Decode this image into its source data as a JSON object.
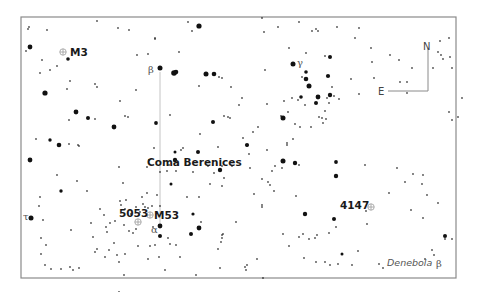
{
  "map": {
    "title": "Coma Berenices",
    "frame": {
      "x": 21,
      "y": 17,
      "width": 435,
      "height": 261,
      "color": "#8a8a8a"
    },
    "compass": {
      "north_label": "N",
      "east_label": "E",
      "corner_x": 428,
      "corner_y": 91,
      "north_top_y": 48,
      "east_left_x": 388
    },
    "constellation_label": {
      "text": "Coma Berenices",
      "x": 147,
      "y": 166
    },
    "objects": [
      {
        "id": "m3",
        "label": "M3",
        "x": 63,
        "y": 52,
        "label_x": 70,
        "label_y": 56
      },
      {
        "id": "m53",
        "label": "M53",
        "x": 150,
        "y": 215,
        "label_x": 155,
        "label_y": 219
      },
      {
        "id": "ngc5053",
        "label": "5053",
        "x": 138,
        "y": 222,
        "label_x": 120,
        "label_y": 217
      },
      {
        "id": "ngc4147",
        "label": "4147",
        "x": 371,
        "y": 207,
        "label_x": 340,
        "label_y": 209
      }
    ],
    "greek_labels": [
      {
        "text": "β",
        "x": 148,
        "y": 73,
        "star": "beta-com"
      },
      {
        "text": "γ",
        "x": 297,
        "y": 66,
        "star": "gamma-com"
      },
      {
        "text": "α",
        "x": 151,
        "y": 233,
        "star": "alpha-com"
      },
      {
        "text": "τ",
        "x": 24,
        "y": 220,
        "star": "tau-boo"
      },
      {
        "text": "β",
        "x": 436,
        "y": 267,
        "star": "beta-leo"
      }
    ],
    "named_stars": [
      {
        "text": "Denebola",
        "x": 387,
        "y": 266
      }
    ],
    "guide_line": {
      "x": 160,
      "y1": 72,
      "y2": 225
    },
    "stars": [
      [
        29,
        27,
        1
      ],
      [
        47,
        30,
        1
      ],
      [
        97,
        21,
        0.9
      ],
      [
        118,
        28,
        1
      ],
      [
        129,
        30,
        1
      ],
      [
        155,
        38,
        1
      ],
      [
        188,
        22,
        1
      ],
      [
        199,
        26,
        2.6
      ],
      [
        192,
        31,
        1
      ],
      [
        30,
        47,
        2.4
      ],
      [
        26,
        51,
        0.8
      ],
      [
        42,
        60,
        1
      ],
      [
        68,
        59,
        1.8
      ],
      [
        50,
        70,
        1
      ],
      [
        57,
        66,
        1
      ],
      [
        40,
        73,
        1
      ],
      [
        70,
        81,
        1
      ],
      [
        45,
        93,
        2.6
      ],
      [
        67,
        89,
        1
      ],
      [
        95,
        84,
        1
      ],
      [
        97,
        87,
        1
      ],
      [
        137,
        55,
        1
      ],
      [
        148,
        54,
        1
      ],
      [
        155,
        39,
        1
      ],
      [
        179,
        52,
        1
      ],
      [
        160,
        68,
        2.5
      ],
      [
        174,
        73,
        2.8
      ],
      [
        176,
        72,
        2.3
      ],
      [
        136,
        90,
        1
      ],
      [
        120,
        101,
        1
      ],
      [
        125,
        116,
        1
      ],
      [
        128,
        117,
        1
      ],
      [
        76,
        112,
        2.4
      ],
      [
        88,
        118,
        2
      ],
      [
        95,
        119,
        1
      ],
      [
        69,
        120,
        1
      ],
      [
        114,
        127,
        2.4
      ],
      [
        156,
        123,
        1.9
      ],
      [
        170,
        115,
        1
      ],
      [
        50,
        140,
        1.7
      ],
      [
        59,
        145,
        2.3
      ],
      [
        69,
        144,
        1
      ],
      [
        78,
        145,
        1
      ],
      [
        28,
        29,
        0.8
      ],
      [
        36,
        139,
        1
      ],
      [
        206,
        74,
        2.5
      ],
      [
        214,
        74,
        2.3
      ],
      [
        219,
        77,
        1
      ],
      [
        199,
        86,
        1
      ],
      [
        222,
        78,
        1
      ],
      [
        231,
        87,
        1
      ],
      [
        242,
        98,
        1
      ],
      [
        213,
        122,
        2
      ],
      [
        224,
        116,
        1
      ],
      [
        228,
        117,
        1
      ],
      [
        200,
        134,
        1
      ],
      [
        198,
        152,
        2
      ],
      [
        218,
        147,
        1
      ],
      [
        230,
        118,
        1
      ],
      [
        239,
        105,
        1
      ],
      [
        262,
        18,
        1
      ],
      [
        278,
        27,
        1
      ],
      [
        299,
        22,
        1
      ],
      [
        318,
        31,
        1
      ],
      [
        264,
        32,
        1
      ],
      [
        289,
        48,
        1
      ],
      [
        293,
        64,
        2.5
      ],
      [
        265,
        70,
        1
      ],
      [
        316,
        29,
        1
      ],
      [
        312,
        31,
        1
      ],
      [
        337,
        27,
        1
      ],
      [
        355,
        38,
        1
      ],
      [
        306,
        53,
        1
      ],
      [
        325,
        56,
        1
      ],
      [
        330,
        57,
        2
      ],
      [
        359,
        28,
        1
      ],
      [
        371,
        48,
        1
      ],
      [
        306,
        79,
        2.3
      ],
      [
        309,
        86,
        2.5
      ],
      [
        306,
        72,
        1.8
      ],
      [
        302,
        77,
        1
      ],
      [
        328,
        76,
        2.1
      ],
      [
        332,
        87,
        1
      ],
      [
        351,
        79,
        1.1
      ],
      [
        318,
        97,
        2.4
      ],
      [
        330,
        95,
        2.2
      ],
      [
        316,
        103,
        2
      ],
      [
        327,
        98,
        1
      ],
      [
        339,
        99,
        1
      ],
      [
        334,
        96,
        1
      ],
      [
        292,
        98,
        1
      ],
      [
        284,
        101,
        1
      ],
      [
        301,
        97,
        1.8
      ],
      [
        298,
        100,
        1
      ],
      [
        305,
        105,
        1
      ],
      [
        288,
        112,
        1
      ],
      [
        281,
        116,
        1
      ],
      [
        325,
        111,
        1
      ],
      [
        322,
        118,
        1
      ],
      [
        329,
        103,
        1
      ],
      [
        359,
        94,
        1
      ],
      [
        374,
        78,
        1
      ],
      [
        372,
        62,
        1
      ],
      [
        390,
        55,
        1
      ],
      [
        400,
        82,
        1
      ],
      [
        407,
        82,
        1
      ],
      [
        407,
        93,
        1
      ],
      [
        399,
        60,
        1
      ],
      [
        412,
        68,
        1
      ],
      [
        433,
        68,
        1
      ],
      [
        438,
        52,
        1
      ],
      [
        441,
        55,
        1
      ],
      [
        443,
        59,
        1
      ],
      [
        440,
        41,
        1
      ],
      [
        449,
        38,
        1
      ],
      [
        450,
        57,
        1
      ],
      [
        452,
        68,
        1
      ],
      [
        462,
        98,
        1
      ],
      [
        449,
        112,
        1
      ],
      [
        452,
        120,
        1
      ],
      [
        458,
        117,
        1
      ],
      [
        283,
        118,
        2.5
      ],
      [
        295,
        124,
        1
      ],
      [
        300,
        127,
        1
      ],
      [
        311,
        127,
        1
      ],
      [
        319,
        117,
        1
      ],
      [
        323,
        123,
        1
      ],
      [
        326,
        119,
        1
      ],
      [
        293,
        139,
        1
      ],
      [
        287,
        145,
        1
      ],
      [
        267,
        104,
        1
      ],
      [
        287,
        143,
        1
      ],
      [
        258,
        127,
        1
      ],
      [
        243,
        138,
        1
      ],
      [
        253,
        132,
        1
      ],
      [
        247,
        146,
        1
      ],
      [
        247,
        145,
        2.1
      ],
      [
        283,
        161,
        2.5
      ],
      [
        295,
        163,
        2.2
      ],
      [
        282,
        168,
        1
      ],
      [
        299,
        165,
        1
      ],
      [
        275,
        166,
        1
      ],
      [
        272,
        171,
        1
      ],
      [
        268,
        182,
        1
      ],
      [
        336,
        162,
        1.9
      ],
      [
        336,
        176,
        2.2
      ],
      [
        365,
        165,
        1
      ],
      [
        397,
        168,
        1
      ],
      [
        296,
        196,
        1
      ],
      [
        274,
        191,
        1
      ],
      [
        262,
        179,
        1
      ],
      [
        250,
        168,
        1
      ],
      [
        262,
        205,
        1
      ],
      [
        305,
        214,
        2.2
      ],
      [
        334,
        219,
        2
      ],
      [
        303,
        234,
        1
      ],
      [
        329,
        233,
        1
      ],
      [
        317,
        235,
        1
      ],
      [
        336,
        227,
        1
      ],
      [
        299,
        237,
        1
      ],
      [
        309,
        239,
        1
      ],
      [
        254,
        194,
        1
      ],
      [
        270,
        185,
        1
      ],
      [
        262,
        207,
        1
      ],
      [
        413,
        174,
        1
      ],
      [
        423,
        175,
        1
      ],
      [
        405,
        182,
        1
      ],
      [
        422,
        184,
        1
      ],
      [
        438,
        203,
        1
      ],
      [
        427,
        195,
        1
      ],
      [
        411,
        210,
        1
      ],
      [
        389,
        193,
        1
      ],
      [
        366,
        211,
        1
      ],
      [
        423,
        218,
        1
      ],
      [
        445,
        239,
        1
      ],
      [
        445,
        236,
        2
      ],
      [
        452,
        239,
        1
      ],
      [
        425,
        259,
        1
      ],
      [
        432,
        250,
        1
      ],
      [
        434,
        255,
        1
      ],
      [
        358,
        251,
        1
      ],
      [
        379,
        264,
        1
      ],
      [
        383,
        268,
        1
      ],
      [
        352,
        265,
        1
      ],
      [
        342,
        254,
        1.5
      ],
      [
        325,
        262,
        1
      ],
      [
        304,
        258,
        1
      ],
      [
        316,
        262,
        1
      ],
      [
        289,
        246,
        1
      ],
      [
        257,
        259,
        1
      ],
      [
        246,
        270,
        1
      ],
      [
        330,
        265,
        1
      ],
      [
        338,
        264,
        1
      ],
      [
        315,
        238,
        1
      ],
      [
        283,
        234,
        1
      ],
      [
        367,
        224,
        1
      ],
      [
        245,
        267,
        1
      ],
      [
        247,
        265,
        1
      ],
      [
        263,
        278,
        1
      ],
      [
        222,
        186,
        1
      ],
      [
        210,
        184,
        1
      ],
      [
        187,
        197,
        1
      ],
      [
        199,
        197,
        1
      ],
      [
        224,
        178,
        1
      ],
      [
        222,
        166,
        1
      ],
      [
        208,
        166,
        1
      ],
      [
        193,
        172,
        1
      ],
      [
        214,
        173,
        1
      ],
      [
        232,
        166,
        1
      ],
      [
        175,
        160,
        2.2
      ],
      [
        175,
        152,
        1.5
      ],
      [
        167,
        171,
        1
      ],
      [
        149,
        160,
        1
      ],
      [
        154,
        148,
        1
      ],
      [
        147,
        167,
        1
      ],
      [
        160,
        172,
        1
      ],
      [
        169,
        165,
        1
      ],
      [
        181,
        150,
        1
      ],
      [
        183,
        148,
        1
      ],
      [
        171,
        184,
        1.5
      ],
      [
        176,
        171,
        1
      ],
      [
        157,
        195,
        1
      ],
      [
        142,
        197,
        1
      ],
      [
        147,
        193,
        1
      ],
      [
        136,
        207,
        1
      ],
      [
        143,
        204,
        1
      ],
      [
        152,
        206,
        1
      ],
      [
        126,
        200,
        1
      ],
      [
        120,
        201,
        1
      ],
      [
        125,
        209,
        1
      ],
      [
        115,
        221,
        1
      ],
      [
        124,
        225,
        1
      ],
      [
        129,
        231,
        1
      ],
      [
        133,
        233,
        1
      ],
      [
        136,
        229,
        1
      ],
      [
        153,
        227,
        1.3
      ],
      [
        160,
        226,
        2.4
      ],
      [
        160,
        236,
        2
      ],
      [
        150,
        246,
        1
      ],
      [
        138,
        246,
        1
      ],
      [
        155,
        245,
        1
      ],
      [
        168,
        238,
        1
      ],
      [
        176,
        245,
        1
      ],
      [
        191,
        234,
        2
      ],
      [
        199,
        228,
        2.4
      ],
      [
        201,
        222,
        1
      ],
      [
        193,
        214,
        1.6
      ],
      [
        170,
        244,
        1
      ],
      [
        180,
        257,
        1
      ],
      [
        148,
        259,
        1
      ],
      [
        159,
        257,
        1
      ],
      [
        165,
        270,
        1
      ],
      [
        196,
        275,
        1
      ],
      [
        220,
        268,
        1
      ],
      [
        218,
        249,
        1
      ],
      [
        222,
        238,
        1
      ],
      [
        223,
        234,
        1
      ],
      [
        236,
        222,
        1
      ],
      [
        222,
        235,
        1
      ],
      [
        221,
        242,
        1
      ],
      [
        125,
        254,
        1.1
      ],
      [
        109,
        250,
        1
      ],
      [
        105,
        257,
        1
      ],
      [
        95,
        252,
        1
      ],
      [
        117,
        255,
        1
      ],
      [
        119,
        262,
        1
      ],
      [
        124,
        275,
        1
      ],
      [
        119,
        292,
        1
      ],
      [
        70,
        267,
        1
      ],
      [
        79,
        268,
        1
      ],
      [
        73,
        270,
        1
      ],
      [
        51,
        269,
        1
      ],
      [
        45,
        265,
        1
      ],
      [
        61,
        269,
        1
      ],
      [
        41,
        254,
        1
      ],
      [
        46,
        245,
        1
      ],
      [
        41,
        238,
        1
      ],
      [
        31,
        218,
        2.5
      ],
      [
        43,
        220,
        1
      ],
      [
        39,
        206,
        1
      ],
      [
        71,
        230,
        1
      ],
      [
        57,
        175,
        1
      ],
      [
        61,
        191,
        1.7
      ],
      [
        30,
        160,
        2.4
      ],
      [
        40,
        197,
        1
      ],
      [
        77,
        181,
        1
      ],
      [
        87,
        191,
        1
      ],
      [
        79,
        146,
        1
      ],
      [
        110,
        223,
        1
      ],
      [
        106,
        227,
        1
      ],
      [
        107,
        232,
        1
      ],
      [
        114,
        243,
        1
      ],
      [
        131,
        214,
        1
      ],
      [
        140,
        212,
        1
      ],
      [
        145,
        207,
        1
      ],
      [
        148,
        208,
        1
      ],
      [
        123,
        183,
        1
      ],
      [
        119,
        167,
        1
      ],
      [
        121,
        205,
        1
      ],
      [
        100,
        209,
        1
      ],
      [
        104,
        215,
        1
      ],
      [
        91,
        223,
        1
      ],
      [
        93,
        237,
        1
      ],
      [
        97,
        249,
        1
      ],
      [
        160,
        206,
        1
      ],
      [
        220,
        170,
        2.2
      ],
      [
        249,
        154,
        1
      ],
      [
        267,
        150,
        1
      ]
    ]
  }
}
